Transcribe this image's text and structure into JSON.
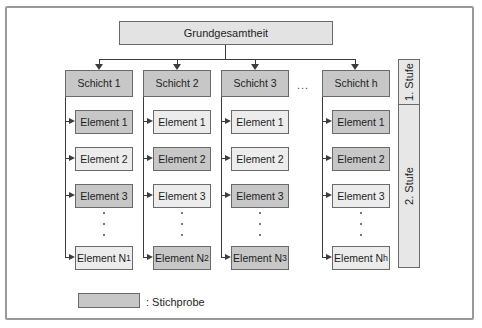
{
  "diagram": {
    "population": "Grundgesamtheit",
    "ellipsis": "...",
    "stages": [
      {
        "label": "1. Stufe"
      },
      {
        "label": "2. Stufe"
      }
    ],
    "legend": {
      "label": ": Stichprobe"
    },
    "columns": [
      {
        "header": "Schicht 1",
        "elements": [
          {
            "label": "Element 1",
            "shaded": true
          },
          {
            "label": "Element 2",
            "shaded": false
          },
          {
            "label": "Element 3",
            "shaded": true
          },
          {
            "label": "Element N",
            "sub": "1",
            "shaded": false
          }
        ]
      },
      {
        "header": "Schicht 2",
        "elements": [
          {
            "label": "Element 1",
            "shaded": false
          },
          {
            "label": "Element 2",
            "shaded": true
          },
          {
            "label": "Element 3",
            "shaded": false
          },
          {
            "label": "Element N",
            "sub": "2",
            "shaded": true
          }
        ]
      },
      {
        "header": "Schicht 3",
        "elements": [
          {
            "label": "Element 1",
            "shaded": false
          },
          {
            "label": "Element 2",
            "shaded": false
          },
          {
            "label": "Element 3",
            "shaded": true
          },
          {
            "label": "Element N",
            "sub": "3",
            "shaded": true
          }
        ]
      },
      {
        "header": "Schicht h",
        "elements": [
          {
            "label": "Element 1",
            "shaded": true
          },
          {
            "label": "Element 2",
            "shaded": true
          },
          {
            "label": "Element 3",
            "shaded": false
          },
          {
            "label": "Element N",
            "sub": "h",
            "shaded": false
          }
        ]
      }
    ],
    "colors": {
      "shaded": "#c7c7c7",
      "light": "#ececec",
      "population_fill": "#e3e3e3",
      "stufe_fill": "#e7e7e7",
      "box_border": "#6a6a6a",
      "connector": "#3c3c3c"
    }
  }
}
